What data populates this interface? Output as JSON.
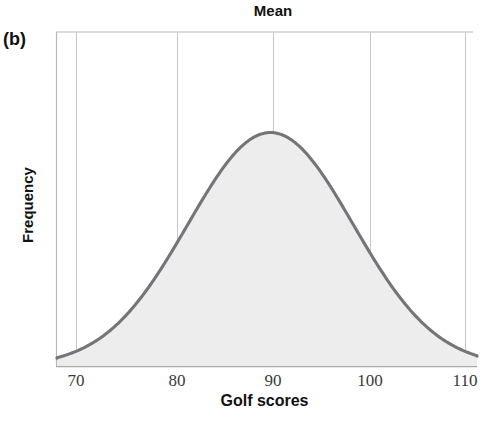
{
  "panel": {
    "label": "(b)"
  },
  "chart_data": {
    "type": "line",
    "title": "Mean",
    "xlabel": "Golf scores",
    "ylabel": "Frequency",
    "xlim": [
      66,
      114
    ],
    "ylim": [
      0,
      1.08
    ],
    "xticks": [
      70,
      80,
      90,
      100,
      110
    ],
    "xtick_labels": [
      "70",
      "80",
      "90",
      "100",
      "110"
    ],
    "yticks": [],
    "ytick_labels": [],
    "grid": "vertical-only",
    "legend": "none",
    "annotations": [
      {
        "text": "Mean",
        "x": 90,
        "placement": "above-plot-center",
        "note": "label marks the mean of the distribution at x = 90"
      },
      {
        "text": "(b)",
        "placement": "outside-top-left",
        "note": "figure panel identifier"
      }
    ],
    "series": [
      {
        "name": "Golf score distribution",
        "kind": "normal-curve",
        "mean": 90,
        "std_dev": 8.5,
        "fill": true,
        "stroke_color": "#74757a",
        "fill_color": "#ededed",
        "x": [
          66,
          68,
          70,
          72,
          74,
          76,
          78,
          80,
          82,
          84,
          86,
          88,
          90,
          92,
          94,
          96,
          98,
          100,
          102,
          104,
          106,
          108,
          110,
          112,
          114
        ],
        "y": [
          0.008,
          0.016,
          0.031,
          0.056,
          0.094,
          0.148,
          0.219,
          0.306,
          0.404,
          0.505,
          0.6,
          0.679,
          0.733,
          0.755,
          0.742,
          0.696,
          0.622,
          0.53,
          0.431,
          0.336,
          0.25,
          0.177,
          0.12,
          0.077,
          0.047
        ]
      }
    ],
    "colors": {
      "curve": "#74757a",
      "fill": "#ededed",
      "grid": "#c9c9c9",
      "axis": "#b5b5b5",
      "text": "#111111",
      "tick_text": "#3a3a3a"
    }
  },
  "geometry": {
    "plot_left": 56,
    "plot_right": 473,
    "plot_top": 32,
    "plot_bottom": 366,
    "gridlines_x": [
      76,
      177,
      273,
      370,
      465
    ]
  }
}
